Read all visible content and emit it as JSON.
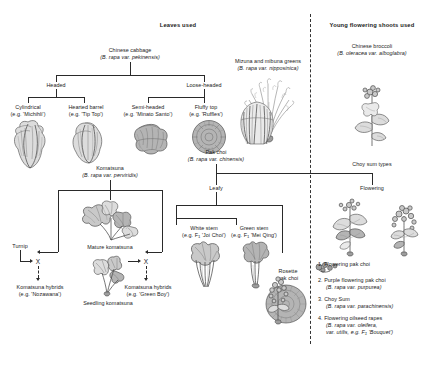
{
  "figure": {
    "headers": {
      "leaves_used": "Leaves used",
      "young_shoots_used": "Young flowering shoots used"
    },
    "taxa": {
      "chinese_cabbage": {
        "common": "Chinese cabbage",
        "latin": "(B. rapa var. pekinensis)"
      },
      "mizuna": {
        "common": "Mizuna and mibuna greens",
        "latin": "(B. rapa var. nipposinica)"
      },
      "chinese_broccoli": {
        "common": "Chinese broccoli",
        "latin": "(B. oleracea var. alboglabra)"
      },
      "komatsuna": {
        "common": "Komatsuna",
        "latin": "(B. rapa var. perviridis)"
      },
      "pak_choi": {
        "common": "Pak choi",
        "latin": "(B. rapa var. chinensis)"
      }
    },
    "chinese_cabbage_branches": {
      "headed": "Headed",
      "loose_headed": "Loose-headed",
      "types": [
        {
          "name": "Cylindrical",
          "cultivar": "(e.g. 'Michihli')"
        },
        {
          "name": "Hearted barrel",
          "cultivar": "(e.g. 'Tip Top')"
        },
        {
          "name": "Semi-headed",
          "cultivar": "(e.g. 'Minato Santo')"
        },
        {
          "name": "Fluffy top",
          "cultivar": "(e.g. 'Ruffles')"
        }
      ]
    },
    "komatsuna_section": {
      "turnip": "Turnip",
      "mature": "Mature komatsuna",
      "seedling": "Seedling komatsuna",
      "cross_symbol": "X",
      "hybrids_left": {
        "name": "Komatsuna hybrids",
        "cultivar": "(e.g. 'Nozawana')"
      },
      "hybrids_right": {
        "name": "Komatsuna hybrids",
        "cultivar": "(e.g. 'Green Boy')"
      }
    },
    "pak_choi_section": {
      "leafy": "Leafy",
      "white_stem": {
        "name": "White stem",
        "cultivar_pre": "(e.g. F",
        "cultivar_sub": "1",
        "cultivar_post": " 'Joi Choi')"
      },
      "green_stem": {
        "name": "Green stem",
        "cultivar_pre": "(e.g. F",
        "cultivar_sub": "1",
        "cultivar_post": " 'Mei Qing')"
      },
      "rosette_line1": "Rosette",
      "rosette_line2": "pak choi"
    },
    "choy_sum_section": {
      "title": "Choy sum types",
      "flowering": "Flowering",
      "list": [
        {
          "num": "1.",
          "name": "Flowering pak choi",
          "latin": ""
        },
        {
          "num": "2.",
          "name": "Purple flowering pak choi",
          "latin": "(B. rapa var. purpurea)"
        },
        {
          "num": "3.",
          "name": "Choy Sum",
          "latin": "(B. rapa var. parachinensis)"
        },
        {
          "num": "4.",
          "name": "Flowering oilseed rapes",
          "latin": "(B. rapa var. oleifera,",
          "latin2_pre": "var. utilis, e.g. F",
          "latin2_sub": "1",
          "latin2_post": " 'Bouquet')"
        }
      ]
    },
    "colors": {
      "ink": "#1a1a1a",
      "line": "#2a2a2a",
      "illustration": "#808080"
    }
  }
}
